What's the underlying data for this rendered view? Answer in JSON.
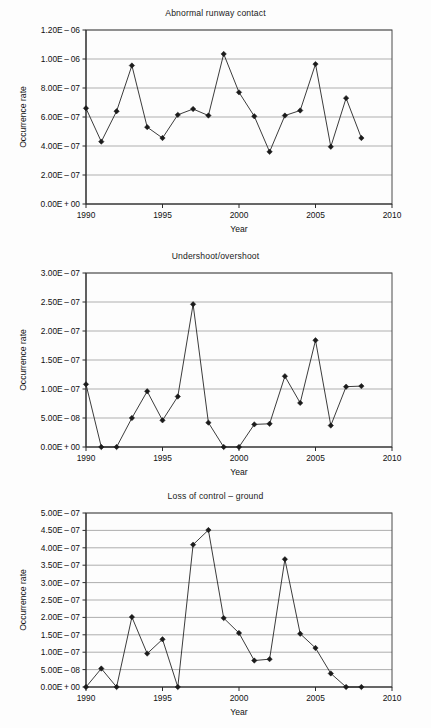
{
  "page": {
    "background_color": "#fdfdfd",
    "ink_color": "#1a1a1a",
    "grid_color": "#8d8d8d"
  },
  "charts": [
    {
      "id": "abnormal-runway-contact",
      "title": "Abnormal runway contact",
      "xlabel": "Year",
      "ylabel": "Occurrence rate",
      "xticks": [
        "1990",
        "1995",
        "2000",
        "2005",
        "2010"
      ],
      "yticks": [
        "0.00E+00",
        "2.00E-07",
        "4.00E-07",
        "6.00E-07",
        "8.00E-07",
        "1.00E-06",
        "1.20E-06"
      ]
    },
    {
      "id": "undershoot-overshoot",
      "title": "Undershoot/overshoot",
      "xlabel": "Year",
      "ylabel": "Occurrence rate",
      "xticks": [
        "1990",
        "1995",
        "2000",
        "2005",
        "2010"
      ],
      "yticks": [
        "0.00E+00",
        "5.00E-08",
        "1.00E-07",
        "1.50E-07",
        "2.00E-07",
        "2.50E-07",
        "3.00E-07"
      ]
    },
    {
      "id": "loss-of-control-ground",
      "title": "Loss of control – ground",
      "xlabel": "Year",
      "ylabel": "Occurrence rate",
      "xticks": [
        "1990",
        "1995",
        "2000",
        "2005",
        "2010"
      ],
      "yticks": [
        "0.00E+00",
        "5.00E-08",
        "1.00E-07",
        "1.50E-07",
        "2.00E-07",
        "2.50E-07",
        "3.00E-07",
        "3.50E-07",
        "4.00E-07",
        "4.50E-07",
        "5.00E-07"
      ]
    }
  ],
  "chart_data": [
    {
      "type": "line",
      "title": "Abnormal runway contact",
      "xlabel": "Year",
      "ylabel": "Occurrence rate",
      "xlim": [
        1990,
        2010
      ],
      "ylim": [
        0,
        1.2e-06
      ],
      "ytick_values": [
        0,
        2e-07,
        4e-07,
        6e-07,
        8e-07,
        1e-06,
        1.2e-06
      ],
      "xtick_values": [
        1990,
        1995,
        2000,
        2005,
        2010
      ],
      "grid": true,
      "legend": "none",
      "x": [
        1990,
        1991,
        1992,
        1993,
        1994,
        1995,
        1996,
        1997,
        1998,
        1999,
        2000,
        2001,
        2002,
        2003,
        2004,
        2005,
        2006,
        2007,
        2008
      ],
      "values": [
        6.6e-07,
        4.3e-07,
        6.4e-07,
        9.55e-07,
        5.3e-07,
        4.55e-07,
        6.15e-07,
        6.55e-07,
        6.1e-07,
        1.035e-06,
        7.7e-07,
        6.05e-07,
        3.6e-07,
        6.1e-07,
        6.45e-07,
        9.65e-07,
        3.95e-07,
        7.3e-07,
        4.55e-07
      ]
    },
    {
      "type": "line",
      "title": "Undershoot/overshoot",
      "xlabel": "Year",
      "ylabel": "Occurrence rate",
      "xlim": [
        1990,
        2010
      ],
      "ylim": [
        0,
        3e-07
      ],
      "ytick_values": [
        0,
        5e-08,
        1e-07,
        1.5e-07,
        2e-07,
        2.5e-07,
        3e-07
      ],
      "xtick_values": [
        1990,
        1995,
        2000,
        2005,
        2010
      ],
      "grid": true,
      "legend": "none",
      "x": [
        1990,
        1991,
        1992,
        1993,
        1994,
        1995,
        1996,
        1997,
        1998,
        1999,
        2000,
        2001,
        2002,
        2003,
        2004,
        2005,
        2006,
        2007,
        2008
      ],
      "values": [
        1.08e-07,
        0.0,
        0.0,
        5e-08,
        9.6e-08,
        4.6e-08,
        8.7e-08,
        2.46e-07,
        4.2e-08,
        0.0,
        0.0,
        3.9e-08,
        4e-08,
        1.22e-07,
        7.6e-08,
        1.84e-07,
        3.7e-08,
        1.04e-07,
        1.05e-07
      ]
    },
    {
      "type": "line",
      "title": "Loss of control – ground",
      "xlabel": "Year",
      "ylabel": "Occurrence rate",
      "xlim": [
        1990,
        2010
      ],
      "ylim": [
        0,
        5e-07
      ],
      "ytick_values": [
        0,
        5e-08,
        1e-07,
        1.5e-07,
        2e-07,
        2.5e-07,
        3e-07,
        3.5e-07,
        4e-07,
        4.5e-07,
        5e-07
      ],
      "xtick_values": [
        1990,
        1995,
        2000,
        2005,
        2010
      ],
      "grid": true,
      "legend": "none",
      "x": [
        1990,
        1991,
        1992,
        1993,
        1994,
        1995,
        1996,
        1997,
        1998,
        1999,
        2000,
        2001,
        2002,
        2003,
        2004,
        2005,
        2006,
        2007,
        2008
      ],
      "values": [
        0.0,
        5.3e-08,
        0.0,
        2.01e-07,
        9.6e-08,
        1.37e-07,
        0.0,
        4.09e-07,
        4.51e-07,
        1.98e-07,
        1.55e-07,
        7.6e-08,
        8e-08,
        3.67e-07,
        1.53e-07,
        1.12e-07,
        3.9e-08,
        0.0,
        0.0
      ]
    }
  ]
}
